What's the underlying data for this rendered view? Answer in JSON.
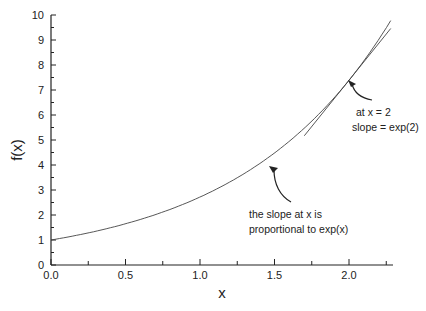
{
  "chart_data": {
    "type": "line",
    "title": "",
    "xlabel": "x",
    "ylabel": "f(x)",
    "xlim": [
      0.0,
      2.3
    ],
    "ylim": [
      0,
      10
    ],
    "x_ticks": [
      "0.0",
      "0.5",
      "1.0",
      "1.5",
      "2.0"
    ],
    "y_ticks": [
      "0",
      "1",
      "2",
      "3",
      "4",
      "5",
      "6",
      "7",
      "8",
      "9",
      "10"
    ],
    "grid": false,
    "legend": null,
    "series": [
      {
        "name": "exp(x)",
        "x": [
          0.0,
          0.25,
          0.5,
          0.75,
          1.0,
          1.25,
          1.5,
          1.75,
          2.0,
          2.28
        ],
        "values": [
          1.0,
          1.28,
          1.65,
          2.12,
          2.72,
          3.49,
          4.48,
          5.75,
          7.39,
          9.78
        ]
      },
      {
        "name": "tangent at x = 2",
        "x": [
          1.7,
          2.28
        ],
        "values": [
          5.17,
          9.46
        ]
      }
    ],
    "annotations": [
      {
        "lines": [
          "at  x = 2",
          "slope = exp(2)"
        ],
        "arrow_to": [
          2.02,
          7.6
        ]
      },
      {
        "lines": [
          "the slope at x is",
          "proportional to exp(x)"
        ],
        "arrow_to": [
          1.6,
          4.7
        ]
      }
    ]
  }
}
